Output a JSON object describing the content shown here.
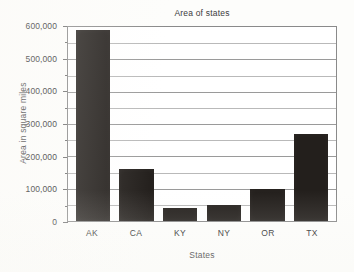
{
  "chart_data": {
    "type": "bar",
    "title": "Area of states",
    "xlabel": "States",
    "ylabel": "Area in square miles",
    "categories": [
      "AK",
      "CA",
      "KY",
      "NY",
      "OR",
      "TX"
    ],
    "values": [
      590000,
      160000,
      40000,
      49000,
      98000,
      268000
    ],
    "ylim": [
      0,
      600000
    ],
    "ytick_values": [
      0,
      100000,
      200000,
      300000,
      400000,
      500000,
      600000
    ],
    "ytick_labels": [
      "0",
      "100,000",
      "200,000",
      "300,000",
      "400,000",
      "500,000",
      "600,000"
    ],
    "minor_tick_interval": 50000,
    "grid": true,
    "legend": false,
    "bar_color": "#231f1c",
    "grid_color": "#9a9a9a",
    "axis_color": "#8a8a8a",
    "background_color": "#fdfdfb"
  }
}
